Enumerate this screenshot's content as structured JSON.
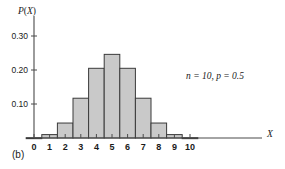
{
  "figure": {
    "panel_label": "(b)",
    "annotation": "n = 10, p = 0.5",
    "xlabel": "X",
    "ylabel": "P(X)"
  },
  "style": {
    "bar_fill": "#c9c9c9",
    "bar_stroke": "#3a3a3a",
    "axis_color": "#4a4a4a",
    "background": "#ffffff"
  },
  "chart_data": {
    "type": "bar",
    "title": "",
    "subtitle": "",
    "xlabel": "X",
    "ylabel": "P(X)",
    "categories": [
      "0",
      "1",
      "2",
      "3",
      "4",
      "5",
      "6",
      "7",
      "8",
      "9",
      "10"
    ],
    "values": [
      0.001,
      0.01,
      0.044,
      0.117,
      0.205,
      0.246,
      0.205,
      0.117,
      0.044,
      0.01,
      0.001
    ],
    "xlim": [
      -0.5,
      10.5
    ],
    "ylim": [
      0,
      0.33
    ],
    "xticks": [
      "0",
      "1",
      "2",
      "3",
      "4",
      "5",
      "6",
      "7",
      "8",
      "9",
      "10"
    ],
    "yticks": [
      "0.10",
      "0.20",
      "0.30"
    ],
    "ytick_values": [
      0.1,
      0.2,
      0.3
    ],
    "grid": false,
    "legend": false,
    "annotations": [
      "n = 10, p = 0.5"
    ],
    "panel": "(b)",
    "distribution": "binomial",
    "parameters": {
      "n": 10,
      "p": 0.5
    }
  }
}
